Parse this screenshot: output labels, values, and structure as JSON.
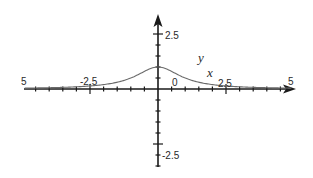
{
  "chart_data": {
    "type": "line",
    "title": "",
    "xlabel": "x",
    "ylabel": "y",
    "function": "y = 1/(1+x^2)",
    "xlim": [
      -5,
      5
    ],
    "ylim": [
      -3.5,
      3.3
    ],
    "grid": false,
    "legend": null,
    "x_tick_step": 0.5,
    "y_tick_step": 0.5,
    "x_tick_labels": [
      {
        "value": -5,
        "text": "5",
        "clipped": true
      },
      {
        "value": -2.5,
        "text": "-2.5"
      },
      {
        "value": 0,
        "text": "0"
      },
      {
        "value": 2.5,
        "text": "2.5"
      },
      {
        "value": 5,
        "text": "5",
        "clipped": true
      }
    ],
    "y_tick_labels": [
      {
        "value": 2.5,
        "text": "2.5"
      },
      {
        "value": -2.5,
        "text": "-2.5"
      }
    ],
    "series": [
      {
        "name": "y",
        "x": [
          -5,
          -4.5,
          -4,
          -3.5,
          -3,
          -2.5,
          -2,
          -1.5,
          -1,
          -0.5,
          0,
          0.5,
          1,
          1.5,
          2,
          2.5,
          3,
          3.5,
          4,
          4.5,
          5
        ],
        "values": [
          0.04,
          0.05,
          0.06,
          0.08,
          0.1,
          0.14,
          0.2,
          0.31,
          0.5,
          0.8,
          1.0,
          0.8,
          0.5,
          0.31,
          0.2,
          0.14,
          0.1,
          0.08,
          0.06,
          0.05,
          0.04
        ]
      }
    ],
    "annotations": [
      {
        "text": "y",
        "near": [
          1.7,
          1.4
        ]
      },
      {
        "text": "x",
        "near": [
          2.0,
          0.6
        ]
      }
    ],
    "colors": {
      "axis": "#1a1a1a",
      "curve": "#6a6a6a",
      "text": "#2a2a2a",
      "background": "#ffffff"
    }
  },
  "labels": {
    "x_left_clipped": "5",
    "x_neg": "-2.5",
    "x_zero": "0",
    "x_pos": "2.5",
    "x_right_clipped": "5",
    "y_pos": "2.5",
    "y_neg": "-2.5",
    "var_y": "y",
    "var_x": "x"
  }
}
